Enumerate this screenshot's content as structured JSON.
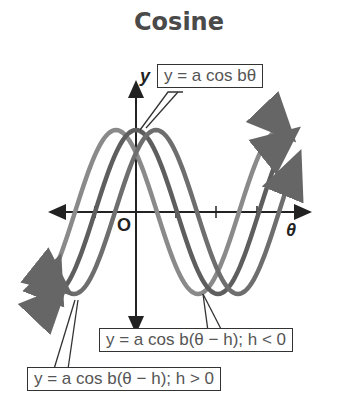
{
  "title": "Cosine",
  "axes": {
    "y_label": "y",
    "x_label": "θ",
    "origin_label": "O"
  },
  "callouts": {
    "base": "y = a cos bθ",
    "h_negative": "y = a cos b(θ − h); h < 0",
    "h_positive": "y = a cos b(θ − h); h > 0"
  },
  "colors": {
    "axis": "#222222",
    "curve_base": "#5e5e5e",
    "curve_h_negative": "#8a8a8a",
    "curve_h_positive": "#6e6e6e"
  },
  "chart_data": {
    "type": "line",
    "title": "Cosine",
    "xlabel": "θ",
    "ylabel": "y",
    "grid": false,
    "series": [
      {
        "name": "y = a cos bθ",
        "phase_shift": 0
      },
      {
        "name": "y = a cos b(θ − h); h < 0",
        "phase_shift": "negative (shifted left)"
      },
      {
        "name": "y = a cos b(θ − h); h > 0",
        "phase_shift": "positive (shifted right)"
      }
    ]
  }
}
